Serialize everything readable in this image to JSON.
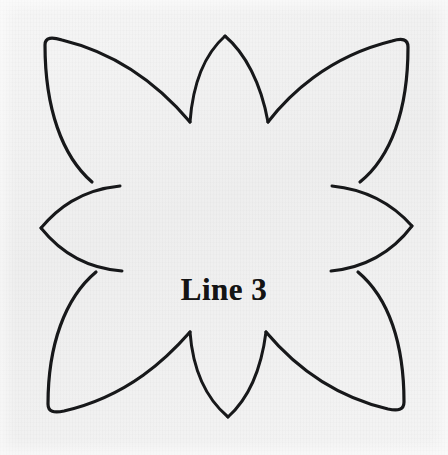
{
  "page": {
    "background_color": "#f3f3f3",
    "width": 448,
    "height": 455
  },
  "figure": {
    "name": "eight-petal-floral-template",
    "caption": "Line 3",
    "stroke_color": "#17181a",
    "stroke_width": 3,
    "fill_color": "none",
    "description_alt": "Eight petal floral quilt block outline"
  },
  "shape_data": {
    "type": "line-art-outline",
    "symmetry": "4-fold",
    "petal_count": 8,
    "petals": [
      {
        "name": "petal-top-left-large",
        "tip_x": 45,
        "tip_y": 38
      },
      {
        "name": "petal-top-right-large",
        "tip_x": 408,
        "tip_y": 40
      },
      {
        "name": "petal-bottom-left-large",
        "tip_x": 48,
        "tip_y": 412
      },
      {
        "name": "petal-bottom-right-large",
        "tip_x": 404,
        "tip_y": 410
      },
      {
        "name": "petal-top-center-small",
        "tip_x": 225,
        "tip_y": 36
      },
      {
        "name": "petal-bottom-center-small",
        "tip_x": 228,
        "tip_y": 417
      },
      {
        "name": "petal-left-center-small",
        "tip_x": 41,
        "tip_y": 228
      },
      {
        "name": "petal-right-center-small",
        "tip_x": 412,
        "tip_y": 226
      }
    ],
    "cusps": [
      {
        "name": "cusp-top-left",
        "x": 190,
        "y": 122
      },
      {
        "name": "cusp-top-right",
        "x": 268,
        "y": 122
      },
      {
        "name": "cusp-left-top",
        "x": 92,
        "y": 182
      },
      {
        "name": "cusp-left-bottom",
        "x": 96,
        "y": 272
      },
      {
        "name": "cusp-right-top",
        "x": 360,
        "y": 182
      },
      {
        "name": "cusp-right-bottom",
        "x": 358,
        "y": 272
      },
      {
        "name": "cusp-bottom-left",
        "x": 190,
        "y": 332
      },
      {
        "name": "cusp-bottom-right",
        "x": 266,
        "y": 332
      }
    ],
    "bounding_box": {
      "x": 41,
      "y": 36,
      "width": 371,
      "height": 381
    }
  }
}
